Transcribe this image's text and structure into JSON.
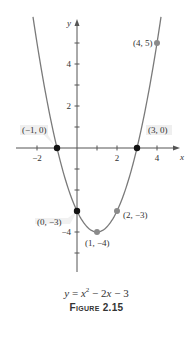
{
  "chart_data": {
    "type": "line",
    "title": "",
    "function": "y = x^2 - 2x - 3",
    "xlabel": "x",
    "ylabel": "y",
    "xlim": [
      -3,
      5
    ],
    "ylim": [
      -6,
      6
    ],
    "x_ticks": [
      -2,
      2,
      4
    ],
    "y_ticks": [
      2,
      4,
      -4
    ],
    "grid": false,
    "legend": null,
    "series": [
      {
        "name": "y = x^2 - 2x - 3",
        "x": [
          -2.2,
          -2,
          -1,
          0,
          1,
          2,
          3,
          4,
          4.2
        ],
        "y": [
          6.24,
          5,
          0,
          -3,
          -4,
          -3,
          0,
          5,
          6.24
        ]
      }
    ],
    "points": [
      {
        "label": "(-1, 0)",
        "x": -1,
        "y": 0,
        "style": "black"
      },
      {
        "label": "(3, 0)",
        "x": 3,
        "y": 0,
        "style": "black"
      },
      {
        "label": "(0, -3)",
        "x": 0,
        "y": -3,
        "style": "black"
      },
      {
        "label": "(1, -4)",
        "x": 1,
        "y": -4,
        "style": "gray"
      },
      {
        "label": "(2, -3)",
        "x": 2,
        "y": -3,
        "style": "gray"
      },
      {
        "label": "(4, 5)",
        "x": 4,
        "y": 5,
        "style": "gray"
      }
    ]
  },
  "axes": {
    "x_name": "x",
    "y_name": "y",
    "x_tick_labels": {
      "m2": "−2",
      "p2": "2",
      "p4": "4"
    },
    "y_tick_labels": {
      "p2": "2",
      "p4": "4",
      "m4": "−4"
    }
  },
  "labels": {
    "p_m1_0": "(−1, 0)",
    "p_3_0": "(3, 0)",
    "p_0_m3": "(0, −3)",
    "p_1_m4": "(1, −4)",
    "p_2_m3": "(2, −3)",
    "p_4_5": "(4, 5)"
  },
  "caption": {
    "equation_y": "y",
    "equation_eq": " = ",
    "equation_x": "x",
    "equation_sup": "2",
    "equation_rest_a": " − 2",
    "equation_x2": "x",
    "equation_rest_b": " − 3",
    "figure": "Figure 2.15"
  },
  "colors": {
    "curve": "#7a7a7a",
    "axis": "#555555",
    "point_black": "#111111",
    "point_gray": "#8a8a8a",
    "label_bg": "#efefef"
  }
}
